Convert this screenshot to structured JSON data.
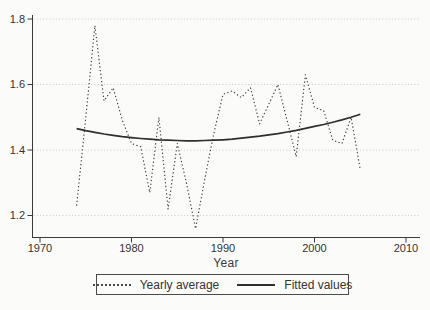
{
  "chart_data": {
    "type": "line",
    "title": "",
    "xlabel": "Year",
    "ylabel": "",
    "x": [
      1974,
      1975,
      1976,
      1977,
      1978,
      1979,
      1980,
      1981,
      1982,
      1983,
      1984,
      1985,
      1986,
      1987,
      1988,
      1989,
      1990,
      1991,
      1992,
      1993,
      1994,
      1995,
      1996,
      1997,
      1998,
      1999,
      2000,
      2001,
      2002,
      2003,
      2004,
      2005
    ],
    "series": [
      {
        "name": "Yearly average",
        "style": "dotted",
        "values": [
          1.23,
          1.5,
          1.78,
          1.55,
          1.59,
          1.49,
          1.42,
          1.41,
          1.27,
          1.5,
          1.22,
          1.42,
          1.3,
          1.16,
          1.31,
          1.45,
          1.57,
          1.58,
          1.56,
          1.59,
          1.48,
          1.54,
          1.6,
          1.49,
          1.38,
          1.63,
          1.53,
          1.52,
          1.43,
          1.42,
          1.5,
          1.34
        ]
      },
      {
        "name": "Fitted values",
        "style": "solid",
        "values": [
          1.465,
          1.459,
          1.454,
          1.449,
          1.445,
          1.441,
          1.438,
          1.435,
          1.433,
          1.431,
          1.43,
          1.429,
          1.428,
          1.428,
          1.429,
          1.43,
          1.431,
          1.433,
          1.436,
          1.439,
          1.442,
          1.446,
          1.45,
          1.455,
          1.46,
          1.466,
          1.472,
          1.478,
          1.485,
          1.492,
          1.5,
          1.509
        ]
      }
    ],
    "xticks": [
      1970,
      1980,
      1990,
      2000,
      2010
    ],
    "yticks": [
      1.2,
      1.4,
      1.6,
      1.8
    ],
    "xlim": [
      1969,
      2011.5
    ],
    "ylim": [
      1.12,
      1.81
    ],
    "grid": "horizontal-dotted",
    "legend_position": "bottom-center"
  },
  "colors": {
    "line": "#3f3f3f",
    "fitted": "#2e2e2e",
    "axis": "#3a3a3a",
    "grid": "#c9c9c9",
    "text": "#333333",
    "background": "#fbfbfa"
  }
}
